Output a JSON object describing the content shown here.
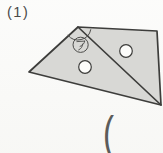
{
  "page": {
    "background_color": "#fafaf8"
  },
  "problem": {
    "number_label": "(1)"
  },
  "figure": {
    "angle_label": "ア",
    "fill_color": "#d8d8d5",
    "outline_color": "#3d3d3b",
    "mark_color": "#4c4c4a",
    "hole_fill_color": "#fcfcfa"
  },
  "next_problem": {
    "partial_label": "("
  }
}
